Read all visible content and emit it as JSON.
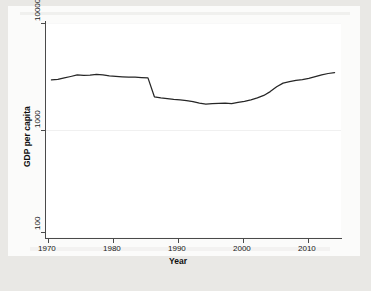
{
  "chart_data": {
    "type": "line",
    "title": "",
    "xlabel": "Year",
    "ylabel": "GDP per capita",
    "yscale": "log",
    "ylim": [
      100,
      10000
    ],
    "xlim": [
      1969,
      2015
    ],
    "y_ticks": [
      100,
      1000,
      10000
    ],
    "y_tick_labels": [
      "100",
      "1000",
      "10000"
    ],
    "x_ticks": [
      1970,
      1980,
      1990,
      2000,
      2010
    ],
    "x_tick_labels": [
      "1970",
      "1980",
      "1990",
      "2000",
      "2010"
    ],
    "grid": "horizontal-faint",
    "legend": "none",
    "line_color": "#262626",
    "series": [
      {
        "name": "GDP per capita",
        "x": [
          1970,
          1971,
          1972,
          1973,
          1974,
          1975,
          1976,
          1977,
          1978,
          1979,
          1980,
          1981,
          1982,
          1983,
          1984,
          1985,
          1986,
          1987,
          1988,
          1989,
          1990,
          1991,
          1992,
          1993,
          1994,
          1995,
          1996,
          1997,
          1998,
          1999,
          2000,
          2001,
          2002,
          2003,
          2004,
          2005,
          2006,
          2007,
          2008,
          2009,
          2010,
          2011,
          2012,
          2013,
          2014
        ],
        "values": [
          2950,
          2990,
          3080,
          3180,
          3290,
          3250,
          3280,
          3330,
          3290,
          3230,
          3190,
          3160,
          3140,
          3130,
          3110,
          3090,
          2060,
          2010,
          1980,
          1950,
          1930,
          1900,
          1860,
          1800,
          1760,
          1780,
          1790,
          1800,
          1780,
          1830,
          1870,
          1930,
          2010,
          2120,
          2300,
          2550,
          2760,
          2850,
          2930,
          2970,
          3050,
          3170,
          3290,
          3390,
          3460
        ]
      }
    ],
    "annotations": [
      {
        "text": "sharp decline between 1985 and 1986",
        "x": 1985.5
      }
    ]
  },
  "axis": {
    "y_title": "GDP per capita",
    "x_title": "Year"
  }
}
